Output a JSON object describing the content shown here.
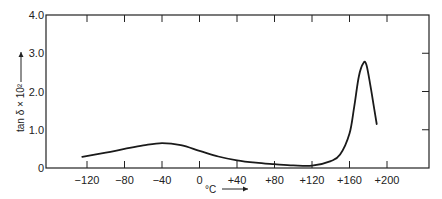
{
  "chart_data": {
    "type": "line",
    "title": "",
    "xlabel": "°C",
    "ylabel": "tan δ × 10²",
    "xlim": [
      -135,
      235
    ],
    "ylim": [
      0,
      4.0
    ],
    "x_ticks": [
      -120,
      -80,
      -40,
      0,
      40,
      80,
      120,
      160,
      200
    ],
    "x_tick_labels": [
      "−120",
      "−80",
      "−40",
      "0",
      "+40",
      "+80",
      "+120",
      "+160",
      "+200"
    ],
    "y_ticks": [
      0,
      1.0,
      2.0,
      3.0,
      4.0
    ],
    "y_tick_labels": [
      "0",
      "1.0",
      "2.0",
      "3.0",
      "4.0"
    ],
    "grid": false,
    "legend": null,
    "series": [
      {
        "name": "tan δ × 10²",
        "x": [
          -125,
          -100,
          -80,
          -60,
          -40,
          -20,
          0,
          20,
          40,
          60,
          80,
          100,
          120,
          140,
          150,
          160,
          165,
          170,
          175,
          178,
          182,
          186,
          189
        ],
        "y": [
          0.29,
          0.4,
          0.5,
          0.59,
          0.65,
          0.6,
          0.45,
          0.3,
          0.2,
          0.14,
          0.1,
          0.07,
          0.06,
          0.18,
          0.35,
          0.9,
          1.6,
          2.4,
          2.75,
          2.7,
          2.2,
          1.6,
          1.15
        ]
      }
    ]
  }
}
